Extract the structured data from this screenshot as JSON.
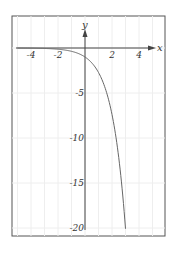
{
  "chart_data": {
    "type": "line",
    "title": "",
    "function": "y = -e^x",
    "xlabel": "x",
    "ylabel": "y",
    "xlim": [
      -5.5,
      5.8
    ],
    "ylim": [
      -21,
      3.5
    ],
    "x_ticks": [
      -4,
      -2,
      2,
      4
    ],
    "x_tick_labels": [
      "-4",
      "-2",
      "2",
      "4"
    ],
    "y_ticks": [
      -5,
      -10,
      -15,
      -20
    ],
    "y_tick_labels": [
      "-5",
      "-10",
      "-15",
      "-20"
    ],
    "grid": true,
    "legend": null,
    "series": [
      {
        "name": "y = -e^x",
        "x": [
          -5.5,
          -4,
          -3,
          -2,
          -1,
          0,
          0.5,
          1,
          1.5,
          2,
          2.5,
          2.75,
          3.0
        ],
        "y": [
          -0.004,
          -0.018,
          -0.05,
          -0.135,
          -0.368,
          -1,
          -1.65,
          -2.72,
          -4.48,
          -7.39,
          -12.18,
          -15.64,
          -20.09
        ]
      }
    ],
    "colors": {
      "curve": "#666666",
      "axes": "#444444",
      "frame": "#555555",
      "grid": "#eeeeee"
    }
  }
}
